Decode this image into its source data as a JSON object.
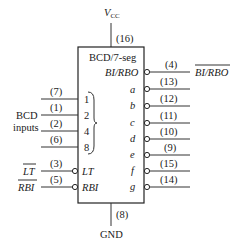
{
  "chip": {
    "title": "BCD/7-seg",
    "vcc_label": "V",
    "vcc_sub": "CC",
    "vcc_pin": "(16)",
    "gnd_label": "GND",
    "gnd_pin": "(8)"
  },
  "inputs": {
    "group_label_line1": "BCD",
    "group_label_line2": "inputs",
    "bcd": [
      {
        "pin": "(7)",
        "weight": "1"
      },
      {
        "pin": "(1)",
        "weight": "2"
      },
      {
        "pin": "(2)",
        "weight": "4"
      },
      {
        "pin": "(6)",
        "weight": "8"
      }
    ],
    "control": [
      {
        "pin": "(3)",
        "inner": "LT",
        "outer": "LT"
      },
      {
        "pin": "(5)",
        "inner": "RBI",
        "outer": "RBI"
      }
    ]
  },
  "outputs": {
    "bi_rbo": {
      "pin": "(4)",
      "inner": "BI/RBO",
      "outer": "BI/RBO"
    },
    "segments": [
      {
        "pin": "(13)",
        "name": "a"
      },
      {
        "pin": "(12)",
        "name": "b"
      },
      {
        "pin": "(11)",
        "name": "c"
      },
      {
        "pin": "(10)",
        "name": "d"
      },
      {
        "pin": "(9)",
        "name": "e"
      },
      {
        "pin": "(15)",
        "name": "f"
      },
      {
        "pin": "(14)",
        "name": "g"
      }
    ]
  }
}
